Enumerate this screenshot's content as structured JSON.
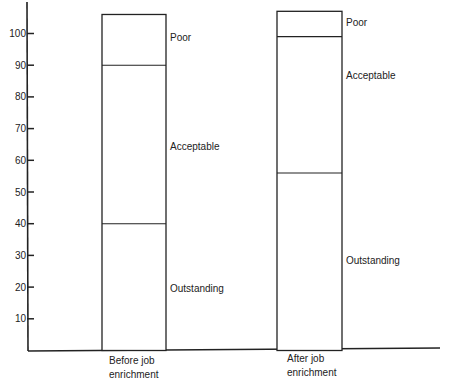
{
  "chart_data": {
    "type": "bar",
    "stacked": true,
    "title": "",
    "xlabel": "",
    "ylabel": "",
    "ylim": [
      0,
      107
    ],
    "yticks": [
      10,
      20,
      30,
      40,
      50,
      60,
      70,
      80,
      90,
      100
    ],
    "grid": false,
    "legend": "inline labels to the right of each bar",
    "categories": [
      "Before job enrichment",
      "After job enrichment"
    ],
    "category_lines": [
      [
        "Before job",
        "enrichment"
      ],
      [
        "After job",
        "enrichment"
      ]
    ],
    "series": [
      {
        "name": "Outstanding",
        "values": [
          40,
          56
        ]
      },
      {
        "name": "Acceptable",
        "values": [
          50,
          43
        ]
      },
      {
        "name": "Poor",
        "values": [
          16,
          8
        ]
      }
    ],
    "boundaries": {
      "Before job enrichment": {
        "outstanding_top": 40,
        "acceptable_top": 90,
        "poor_top": 106
      },
      "After job enrichment": {
        "outstanding_top": 56,
        "acceptable_top": 99,
        "poor_top": 107
      }
    }
  }
}
